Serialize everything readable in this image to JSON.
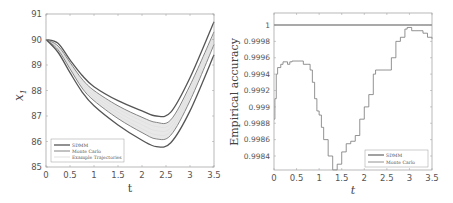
{
  "chart_data": [
    {
      "type": "line",
      "title": "",
      "xlabel": "t",
      "ylabel": "x_1",
      "xlim": [
        0,
        3.5
      ],
      "ylim": [
        85,
        91
      ],
      "xticks": [
        "0",
        "0.5",
        "1",
        "1.5",
        "2",
        "2.5",
        "3",
        "3.5"
      ],
      "yticks": [
        "85",
        "86",
        "87",
        "88",
        "89",
        "90",
        "91"
      ],
      "grid": false,
      "legend_position": "lower left",
      "legend": [
        "SDMM",
        "Monte Carlo",
        "Example Trajectories"
      ],
      "x": [
        0,
        0.25,
        0.5,
        0.75,
        1,
        1.5,
        2,
        2.3,
        2.6,
        3,
        3.5
      ],
      "series": [
        {
          "name": "SDMM upper",
          "legend": "SDMM",
          "values": [
            90.0,
            89.85,
            89.2,
            88.6,
            88.15,
            87.6,
            87.2,
            87.0,
            87.15,
            88.5,
            90.7
          ]
        },
        {
          "name": "Monte Carlo upper",
          "legend": "Monte Carlo",
          "values": [
            90.0,
            89.75,
            89.1,
            88.45,
            88.0,
            87.4,
            86.95,
            86.75,
            86.85,
            88.2,
            90.3
          ]
        },
        {
          "name": "Monte Carlo lower",
          "legend": "Monte Carlo",
          "values": [
            90.0,
            89.6,
            88.85,
            88.1,
            87.6,
            86.9,
            86.35,
            86.1,
            86.25,
            87.6,
            89.8
          ]
        },
        {
          "name": "SDMM lower",
          "legend": "SDMM",
          "values": [
            90.0,
            89.5,
            88.7,
            87.95,
            87.4,
            86.65,
            86.05,
            85.8,
            85.95,
            87.2,
            89.4
          ]
        }
      ],
      "fill_between": [
        "Monte Carlo upper",
        "Monte Carlo lower"
      ]
    },
    {
      "type": "line",
      "title": "",
      "xlabel": "t",
      "ylabel": "Empirical accuracy",
      "xlim": [
        0,
        3.5
      ],
      "ylim": [
        0.99823,
        1.00015
      ],
      "xticks": [
        "0",
        "0.5",
        "1",
        "1.5",
        "2",
        "2.5",
        "3",
        "3.5"
      ],
      "yticks": [
        "0.9984",
        "0.9986",
        "0.9988",
        "0.999",
        "0.9992",
        "0.9994",
        "0.9996",
        "0.9998",
        "1"
      ],
      "grid": false,
      "legend_position": "lower right",
      "legend": [
        "SDMM",
        "Monte Carlo"
      ],
      "series": [
        {
          "name": "SDMM",
          "x": [
            0,
            3.5
          ],
          "values": [
            1.0,
            1.0
          ]
        },
        {
          "name": "Monte Carlo",
          "x": [
            0,
            0.02,
            0.05,
            0.08,
            0.15,
            0.2,
            0.3,
            0.35,
            0.4,
            0.6,
            0.65,
            0.75,
            0.8,
            0.85,
            0.9,
            0.95,
            1.0,
            1.05,
            1.1,
            1.2,
            1.3,
            1.35,
            1.4,
            1.5,
            1.6,
            1.7,
            1.8,
            1.9,
            2.0,
            2.1,
            2.2,
            2.25,
            2.5,
            2.6,
            2.7,
            2.8,
            2.9,
            2.95,
            3.05,
            3.3,
            3.4,
            3.5
          ],
          "values": [
            0.99885,
            0.9991,
            0.9994,
            0.99948,
            0.99952,
            0.99955,
            0.99952,
            0.99955,
            0.99956,
            0.99956,
            0.99952,
            0.99952,
            0.99945,
            0.9993,
            0.9991,
            0.99895,
            0.9989,
            0.99875,
            0.9986,
            0.9984,
            0.99823,
            0.99823,
            0.9983,
            0.99845,
            0.99855,
            0.99858,
            0.99865,
            0.99885,
            0.999,
            0.99915,
            0.9994,
            0.99945,
            0.99945,
            0.9996,
            0.9998,
            0.99985,
            0.99995,
            0.99997,
            0.99993,
            0.9999,
            0.99985,
            0.99983
          ]
        }
      ]
    }
  ],
  "colors": {
    "axis": "#9a9a9a",
    "sdmm": "#555555",
    "monte_carlo": "#777777",
    "fill": "#e6e6e6",
    "text": "#555555"
  }
}
